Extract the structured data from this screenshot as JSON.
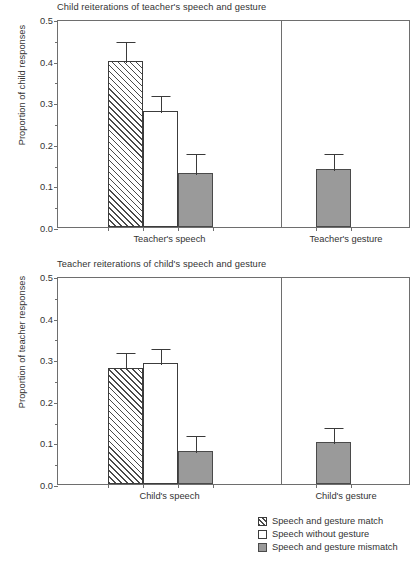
{
  "chart_data": [
    {
      "type": "bar",
      "title": "Child reiterations of teacher's speech and gesture",
      "xlabel": "",
      "ylabel": "Proportion of child responses",
      "ylim": [
        0.0,
        0.5
      ],
      "yticks": [
        "0.0",
        "0.1",
        "0.2",
        "0.3",
        "0.4",
        "0.5"
      ],
      "ytick_values": [
        0.0,
        0.1,
        0.2,
        0.3,
        0.4,
        0.5
      ],
      "minor_tick_interval": 0.05,
      "grid": false,
      "legend_position": "below-right",
      "groups": [
        {
          "category": "Teacher's speech",
          "bars": [
            {
              "series": "Speech and gesture match",
              "value": 0.4,
              "error": 0.05,
              "fill": "hatch"
            },
            {
              "series": "Speech without gesture",
              "value": 0.28,
              "error": 0.04,
              "fill": "open"
            },
            {
              "series": "Speech and gesture mismatch",
              "value": 0.13,
              "error": 0.05,
              "fill": "solid"
            }
          ]
        },
        {
          "category": "Teacher's gesture",
          "bars": [
            {
              "series": "Speech and gesture mismatch",
              "value": 0.14,
              "error": 0.04,
              "fill": "solid"
            }
          ]
        }
      ]
    },
    {
      "type": "bar",
      "title": "Teacher reiterations of child's speech and gesture",
      "xlabel": "",
      "ylabel": "Proportion of teacher responses",
      "ylim": [
        0.0,
        0.5
      ],
      "yticks": [
        "0.0",
        "0.1",
        "0.2",
        "0.3",
        "0.4",
        "0.5"
      ],
      "ytick_values": [
        0.0,
        0.1,
        0.2,
        0.3,
        0.4,
        0.5
      ],
      "minor_tick_interval": 0.05,
      "grid": false,
      "legend_position": "below-right",
      "groups": [
        {
          "category": "Child's speech",
          "bars": [
            {
              "series": "Speech and gesture match",
              "value": 0.28,
              "error": 0.04,
              "fill": "hatch"
            },
            {
              "series": "Speech without gesture",
              "value": 0.29,
              "error": 0.04,
              "fill": "open"
            },
            {
              "series": "Speech and gesture mismatch",
              "value": 0.08,
              "error": 0.04,
              "fill": "solid"
            }
          ]
        },
        {
          "category": "Child's gesture",
          "bars": [
            {
              "series": "Speech and gesture mismatch",
              "value": 0.1,
              "error": 0.04,
              "fill": "solid"
            }
          ]
        }
      ]
    }
  ],
  "legend": {
    "items": [
      {
        "label": "Speech and gesture match",
        "fill": "hatch"
      },
      {
        "label": "Speech without gesture",
        "fill": "open"
      },
      {
        "label": "Speech and gesture mismatch",
        "fill": "solid"
      }
    ]
  },
  "colors": {
    "solid_fill": "#9a9a9a",
    "open_fill": "#ffffff",
    "hatch_line": "#4a4a4a",
    "axis": "#6e6e6e",
    "text": "#333333"
  }
}
